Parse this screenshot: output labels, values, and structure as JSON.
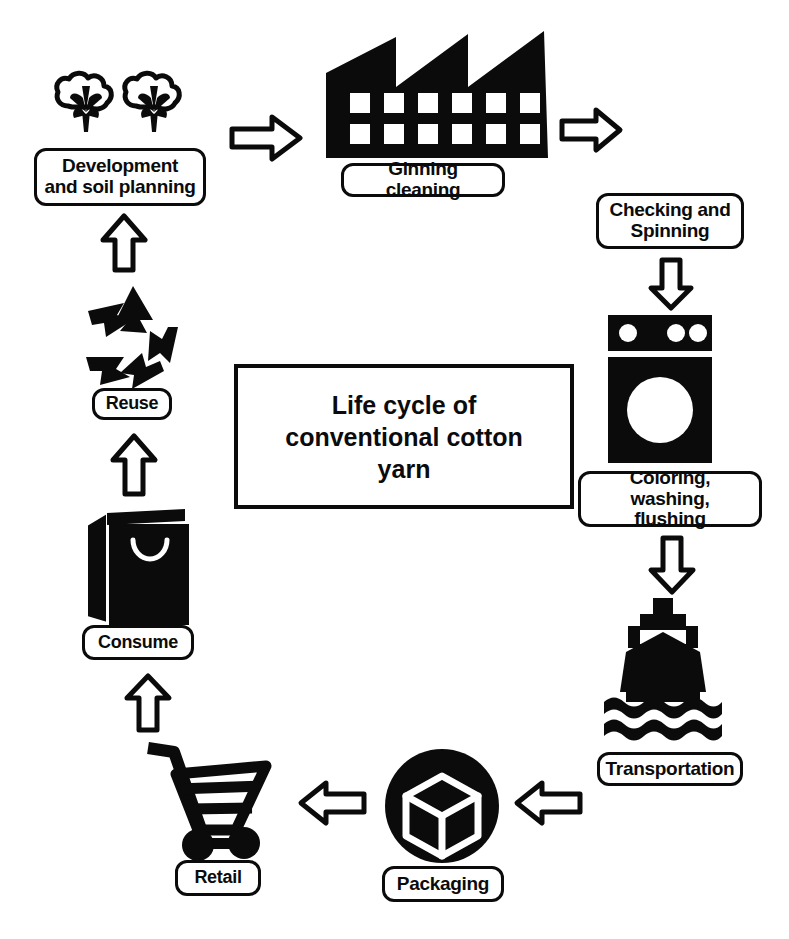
{
  "diagram": {
    "title": "Life cycle of\nconventional cotton\nyarn",
    "colors": {
      "ink": "#0b0b0b",
      "background": "#ffffff",
      "arrow_fill": "#ffffff",
      "arrow_stroke": "#0b0b0b"
    },
    "nodes": [
      {
        "id": "development",
        "label": "Development\nand soil planning",
        "icon": "cotton-boll-icon"
      },
      {
        "id": "ginning",
        "label": "Ginning cleaning",
        "icon": "factory-icon"
      },
      {
        "id": "checking",
        "label": "Checking and\nSpinning",
        "icon": "none"
      },
      {
        "id": "coloring",
        "label": "Coloring, washing,\nflushing",
        "icon": "washing-machine-icon"
      },
      {
        "id": "transportation",
        "label": "Transportation",
        "icon": "cargo-ship-icon"
      },
      {
        "id": "packaging",
        "label": "Packaging",
        "icon": "package-cube-icon"
      },
      {
        "id": "retail",
        "label": "Retail",
        "icon": "shopping-cart-icon"
      },
      {
        "id": "consume",
        "label": "Consume",
        "icon": "shopping-bag-icon"
      },
      {
        "id": "reuse",
        "label": "Reuse",
        "icon": "recycle-icon"
      }
    ],
    "arrows": [
      {
        "id": "development-to-ginning",
        "direction": "right"
      },
      {
        "id": "ginning-to-checking",
        "direction": "right"
      },
      {
        "id": "checking-to-coloring",
        "direction": "down"
      },
      {
        "id": "coloring-to-transportation",
        "direction": "down"
      },
      {
        "id": "transportation-to-packaging",
        "direction": "left"
      },
      {
        "id": "packaging-to-retail",
        "direction": "left"
      },
      {
        "id": "retail-to-consume",
        "direction": "up"
      },
      {
        "id": "consume-to-reuse",
        "direction": "up"
      },
      {
        "id": "reuse-to-development",
        "direction": "up"
      }
    ]
  }
}
